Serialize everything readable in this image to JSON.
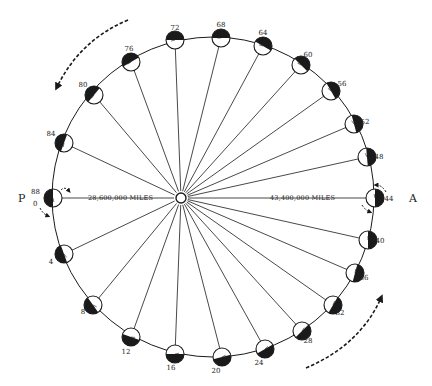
{
  "diagram": {
    "sun": {
      "cx": 181,
      "cy": 198,
      "r": 5
    },
    "orbit": {
      "cx": 213,
      "cy": 197,
      "rx": 161,
      "ry": 160
    },
    "perihelion": {
      "label": "P",
      "distance_label": "28,600,000 MILES"
    },
    "aphelion": {
      "label": "A",
      "distance_label": "43,400,000 MILES"
    },
    "start_label_top": "88",
    "start_label_bottom": "0",
    "planets": [
      {
        "day": "0",
        "x": 53,
        "y": 198,
        "label_x": 0,
        "label_y": 0,
        "dark_angle": 180
      },
      {
        "day": "4",
        "x": 64,
        "y": 254,
        "label_x": 51,
        "label_y": 264,
        "dark_angle": 200
      },
      {
        "day": "8",
        "x": 93,
        "y": 305,
        "label_x": 83,
        "label_y": 314,
        "dark_angle": 215
      },
      {
        "day": "12",
        "x": 131,
        "y": 337,
        "label_x": 126,
        "label_y": 354,
        "dark_angle": 250
      },
      {
        "day": "16",
        "x": 175,
        "y": 354,
        "label_x": 171,
        "label_y": 370,
        "dark_angle": 270
      },
      {
        "day": "20",
        "x": 222,
        "y": 357,
        "label_x": 216,
        "label_y": 373,
        "dark_angle": 285
      },
      {
        "day": "24",
        "x": 265,
        "y": 349,
        "label_x": 259,
        "label_y": 365,
        "dark_angle": 300
      },
      {
        "day": "28",
        "x": 302,
        "y": 331,
        "label_x": 308,
        "label_y": 343,
        "dark_angle": 315
      },
      {
        "day": "32",
        "x": 333,
        "y": 305,
        "label_x": 340,
        "label_y": 315,
        "dark_angle": 330
      },
      {
        "day": "36",
        "x": 355,
        "y": 273,
        "label_x": 364,
        "label_y": 280,
        "dark_angle": 345
      },
      {
        "day": "40",
        "x": 368,
        "y": 240,
        "label_x": 380,
        "label_y": 243,
        "dark_angle": 0
      },
      {
        "day": "44",
        "x": 375,
        "y": 198,
        "label_x": 389,
        "label_y": 201,
        "dark_angle": 0
      },
      {
        "day": "48",
        "x": 367,
        "y": 157,
        "label_x": 379,
        "label_y": 159,
        "dark_angle": 5
      },
      {
        "day": "52",
        "x": 354,
        "y": 124,
        "label_x": 365,
        "label_y": 124,
        "dark_angle": 15
      },
      {
        "day": "56",
        "x": 331,
        "y": 91,
        "label_x": 342,
        "label_y": 86,
        "dark_angle": 30
      },
      {
        "day": "60",
        "x": 301,
        "y": 65,
        "label_x": 308,
        "label_y": 57,
        "dark_angle": 45
      },
      {
        "day": "64",
        "x": 263,
        "y": 46,
        "label_x": 263,
        "label_y": 35,
        "dark_angle": 60
      },
      {
        "day": "68",
        "x": 221,
        "y": 38,
        "label_x": 221,
        "label_y": 27,
        "dark_angle": 90
      },
      {
        "day": "72",
        "x": 175,
        "y": 40,
        "label_x": 175,
        "label_y": 30,
        "dark_angle": 90
      },
      {
        "day": "76",
        "x": 131,
        "y": 62,
        "label_x": 129,
        "label_y": 51,
        "dark_angle": 120
      },
      {
        "day": "80",
        "x": 94,
        "y": 95,
        "label_x": 83,
        "label_y": 87,
        "dark_angle": 140
      },
      {
        "day": "84",
        "x": 64,
        "y": 143,
        "label_x": 51,
        "label_y": 136,
        "dark_angle": 160
      }
    ],
    "arrows": [
      {
        "name": "motion-arrow-top-left",
        "path": "M128,20 Q80,40 57,87",
        "tip_x": 57,
        "tip_y": 87
      },
      {
        "name": "motion-arrow-bottom-right",
        "path": "M306,368 Q360,345 381,298",
        "tip_x": 381,
        "tip_y": 298
      }
    ],
    "colors": {
      "ink": "#1a1a1a",
      "paper": "#ffffff"
    }
  }
}
